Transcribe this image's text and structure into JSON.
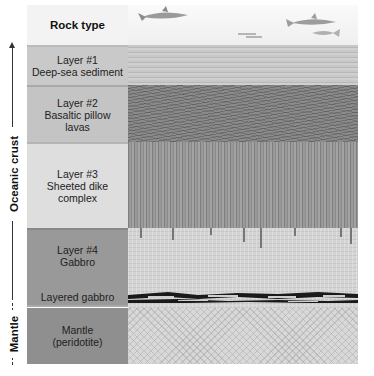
{
  "header": {
    "column_label": "Rock type"
  },
  "layers": [
    {
      "id": "layer1",
      "line1": "Layer #1",
      "line2": "Deep-sea sediment",
      "line3": ""
    },
    {
      "id": "layer2",
      "line1": "Layer #2",
      "line2": "Basaltic pillow",
      "line3": "lavas"
    },
    {
      "id": "layer3",
      "line1": "Layer #3",
      "line2": "Sheeted dike",
      "line3": "complex"
    },
    {
      "id": "layer4",
      "line1": "Layer #4",
      "line2": "Gabbro",
      "line3": ""
    },
    {
      "id": "layered-gabbro",
      "line1": "Layered gabbro",
      "line2": "",
      "line3": ""
    },
    {
      "id": "mantle",
      "line1": "Mantle",
      "line2": "(peridotite)",
      "line3": ""
    }
  ],
  "axis": {
    "crust_label": "Oceanic crust",
    "mantle_label": "Mantle"
  },
  "icons": {
    "ocean": "fish-icons",
    "sediment": "horizontal-stripes",
    "pillow": "pillow-lava-texture",
    "dikes": "vertical-dikes",
    "gabbro": "crystalline-dots",
    "layered": "layered-black-bands",
    "peridotite": "cross-hatch"
  }
}
